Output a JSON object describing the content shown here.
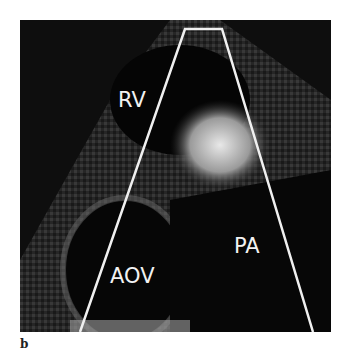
{
  "figure": {
    "panel_label": "b",
    "labels": {
      "rv": "RV",
      "aov": "AOV",
      "pa": "PA"
    },
    "colors": {
      "background": "#ffffff",
      "image_bg": "#111111",
      "sector_outline": "#f0f0f0"
    }
  }
}
